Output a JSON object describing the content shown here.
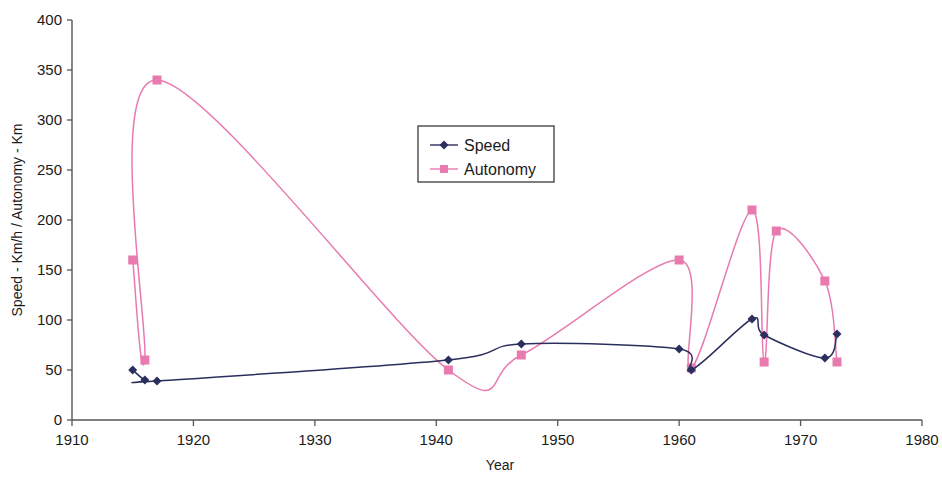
{
  "chart_data": {
    "type": "line",
    "title": "",
    "xlabel": "Year",
    "ylabel": "Speed - Km/h / Autonomy - Km",
    "xlim": [
      1910,
      1980
    ],
    "ylim": [
      0,
      400
    ],
    "xticks": [
      1910,
      1920,
      1930,
      1940,
      1950,
      1960,
      1970,
      1980
    ],
    "yticks": [
      0,
      50,
      100,
      150,
      200,
      250,
      300,
      350,
      400
    ],
    "grid": false,
    "smoothed": true,
    "legend_position": "upper-center",
    "series": [
      {
        "name": "Speed",
        "color": "#2b2f5e",
        "marker": "diamond",
        "x": [
          1915,
          1916,
          1917,
          1941,
          1947,
          1960,
          1961,
          1966,
          1967,
          1972,
          1973
        ],
        "values": [
          50,
          40,
          39,
          60,
          76,
          71,
          50,
          101,
          85,
          62,
          86
        ]
      },
      {
        "name": "Autonomy",
        "color": "#e87ab0",
        "marker": "square",
        "x": [
          1915,
          1916,
          1917,
          1941,
          1947,
          1960,
          1961,
          1966,
          1967,
          1968,
          1972,
          1973
        ],
        "values": [
          160,
          60,
          340,
          50,
          65,
          160,
          52,
          210,
          58,
          189,
          139,
          58
        ]
      }
    ]
  },
  "legend": {
    "items": [
      {
        "label": "Speed",
        "color": "#2b2f5e",
        "marker": "diamond"
      },
      {
        "label": "Autonomy",
        "color": "#e87ab0",
        "marker": "square"
      }
    ]
  },
  "axes": {
    "x_title": "Year",
    "y_title": "Speed - Km/h / Autonomy - Km",
    "x_tick_labels": [
      "1910",
      "1920",
      "1930",
      "1940",
      "1950",
      "1960",
      "1970",
      "1980"
    ],
    "y_tick_labels": [
      "0",
      "50",
      "100",
      "150",
      "200",
      "250",
      "300",
      "350",
      "400"
    ]
  },
  "colors": {
    "speed": "#2b2f5e",
    "autonomy": "#e87ab0",
    "axis": "#555555",
    "text": "#1b1b1b",
    "background": "#ffffff"
  }
}
